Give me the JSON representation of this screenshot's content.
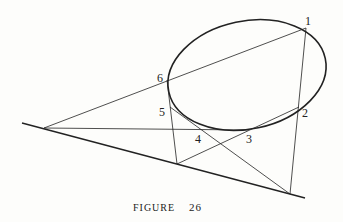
{
  "figure": {
    "caption": "Figure",
    "caption_small_caps": "FIGURE",
    "number": "26"
  },
  "points": [
    {
      "label": "1",
      "x": 306,
      "y": 28
    },
    {
      "label": "2",
      "x": 299,
      "y": 107
    },
    {
      "label": "3",
      "x": 248,
      "y": 130
    },
    {
      "label": "4",
      "x": 201,
      "y": 130
    },
    {
      "label": "5",
      "x": 170,
      "y": 107
    },
    {
      "label": "6",
      "x": 167,
      "y": 80
    }
  ],
  "labels": {
    "p1": "1",
    "p2": "2",
    "p3": "3",
    "p4": "4",
    "p5": "5",
    "p6": "6"
  },
  "colors": {
    "ink": "#222222",
    "paper": "#fdfdfb"
  }
}
